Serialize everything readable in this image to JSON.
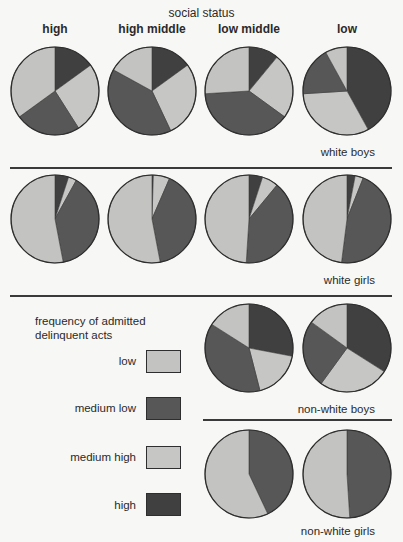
{
  "chart_data": {
    "type": "pie",
    "title": "social status",
    "columns": [
      "high",
      "high middle",
      "low middle",
      "low"
    ],
    "legend": {
      "title": "frequency of admitted delinquent acts",
      "entries": [
        {
          "key": "low",
          "label": "low",
          "color": "#c3c3c1"
        },
        {
          "key": "medium_low",
          "label": "medium low",
          "color": "#575757"
        },
        {
          "key": "medium_high",
          "label": "medium high",
          "color": "#c6c6c4"
        },
        {
          "key": "high",
          "label": "high",
          "color": "#404040"
        }
      ]
    },
    "slice_order_clockwise_from_top": [
      "high",
      "medium_high",
      "medium_low",
      "low"
    ],
    "groups": [
      {
        "label": "white boys",
        "pies": [
          {
            "status": "high",
            "high": 15,
            "medium_high": 26,
            "medium_low": 24,
            "low": 35
          },
          {
            "status": "high middle",
            "high": 15,
            "medium_high": 28,
            "medium_low": 40,
            "low": 17
          },
          {
            "status": "low middle",
            "high": 11,
            "medium_high": 24,
            "medium_low": 39,
            "low": 26
          },
          {
            "status": "low",
            "high": 42,
            "medium_high": 32,
            "medium_low": 18,
            "low": 8
          }
        ]
      },
      {
        "label": "white girls",
        "pies": [
          {
            "status": "high",
            "high": 5,
            "medium_high": 3,
            "medium_low": 39,
            "low": 53
          },
          {
            "status": "high middle",
            "high": 0.5,
            "medium_high": 6,
            "medium_low": 40.5,
            "low": 53
          },
          {
            "status": "low middle",
            "high": 5,
            "medium_high": 6,
            "medium_low": 40,
            "low": 49
          },
          {
            "status": "low",
            "high": 3,
            "medium_high": 3,
            "medium_low": 46,
            "low": 48
          }
        ]
      },
      {
        "label": "non-white boys",
        "pies": [
          {
            "status": "low middle",
            "high": 28,
            "medium_high": 18,
            "medium_low": 38,
            "low": 16
          },
          {
            "status": "low",
            "high": 34,
            "medium_high": 26,
            "medium_low": 25,
            "low": 15
          }
        ]
      },
      {
        "label": "non-white girls",
        "pies": [
          {
            "status": "low middle",
            "high": 0,
            "medium_high": 0,
            "medium_low": 43,
            "low": 57
          },
          {
            "status": "low",
            "high": 0,
            "medium_high": 0,
            "medium_low": 49,
            "low": 51
          }
        ]
      }
    ]
  },
  "layout_hints": {
    "pie_radius": 44,
    "pie_centers": {
      "white boys": [
        [
          55,
          91
        ],
        [
          152,
          91
        ],
        [
          249,
          91
        ],
        [
          347,
          91
        ]
      ],
      "white girls": [
        [
          55,
          219
        ],
        [
          152,
          219
        ],
        [
          249,
          219
        ],
        [
          347,
          219
        ]
      ],
      "non-white boys": [
        [
          249,
          348
        ],
        [
          347,
          348
        ]
      ],
      "non-white girls": [
        [
          249,
          474
        ],
        [
          347,
          474
        ]
      ]
    }
  }
}
